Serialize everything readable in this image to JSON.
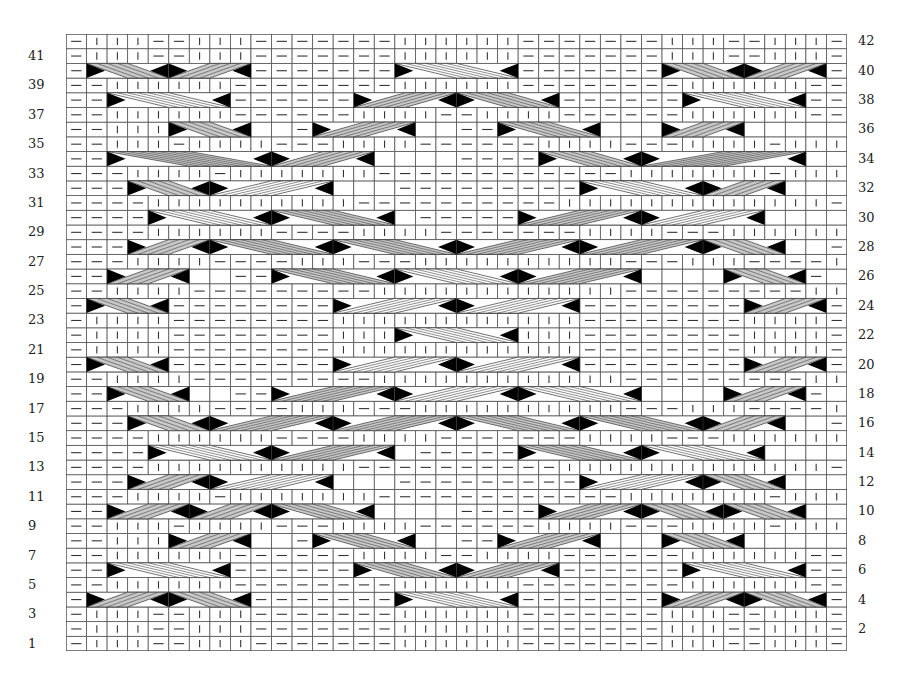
{
  "chart_data": {
    "type": "table",
    "columns": 38,
    "rows": 42,
    "legend": {
      "K": "knit stitch (vertical bar)",
      "P": "purl stitch (horizontal dash)",
      "cable_gray": "gray-filled cable cross",
      "cable_white": "white-filled cable cross",
      "black_triangle": "cable end marker"
    },
    "colors": {
      "grid": "#555555",
      "gray_cable": "#c8c8c8",
      "white_cable": "#ffffff",
      "marker": "#000000",
      "symbol": "#333333"
    },
    "left_labels": [
      "41",
      "39",
      "37",
      "35",
      "33",
      "31",
      "29",
      "27",
      "25",
      "23",
      "21",
      "19",
      "17",
      "15",
      "13",
      "11",
      "9",
      "7",
      "5",
      "3",
      "1"
    ],
    "right_labels": [
      "42",
      "40",
      "38",
      "36",
      "34",
      "32",
      "30",
      "28",
      "26",
      "24",
      "22",
      "20",
      "18",
      "16",
      "14",
      "12",
      "10",
      "8",
      "6",
      "4",
      "2"
    ],
    "row_stitches": {
      "42": "PKKKPPKKKPPPPPPPKKKKKKPPPPPPPKKKPPKKKP",
      "41": "PKKKPPKKKPPPPPPPKKKKKKPPPPPPPKKKPPKKKP",
      "40": "PCCCCCCCCPPPPPPPCCCCCCPPPPPPPCCCCCCCCP",
      "39": "PPKKKKKKPPPPPPPPKKKKKKPPPPPPPPKKKKKKPP",
      "38": "PPCCCCCCPPPPPPCCCCCCCCCCPPPPPPCCCCCCPP",
      "37": "PPKKKKKKPPPPPPKKKKPPKKKKPPPPPPKKKKKKPP",
      "36": "PPKKKCCCCCCPPPCCCCCPPPPPCCCCCPPPCCCCCCKKKPP",
      "35": "PPKKKPKKKKPPPKKKKPPPPPPKKKKPPPKKKKPKKKPP",
      "34": "PPCCCCCCCCCCCCCCCCCPPPPPPPPCCCCCCCCCCCCCCCCCPP",
      "33": "PPPKKKKPKKKKKKKPPPPPPPPPPPPKKKKKKKPKKKKPPP",
      "32": "PPPCCCCCCCCCCCCCPPPPPPPPPPPPCCCCCCCCCCCCCPPP",
      "31": "PPPPKKKKKKKKKKPPPPPPPPPPKKKKKKKKKKKKKPPPP",
      "30": "PPPPCCCCCCCCCCCCCPPPPPPPPCCCCCCCCCCCCCPPPP",
      "29": "PPPPKKKKKKPPPPKKKKPPPPPPPKKKKPPPKKKKKKPPPP",
      "28": "PPPCCCCCCCCCCCCCCCCCCCCCCCCCCCCCCCCCCPPP",
      "27": "PPPKKKKPPPPKKKPPPKKKKKKKKKKPPPKKKPPPPKKKKPPP",
      "26": "PPCCCCCCPPPPPCCCCCCCCCCCCCCCCCCCPPPPPCCCCCCPP",
      "25": "PPKKKKPPPPPPPPPKKKKKKKKKKKKPPPPPPPPPKKKKPP",
      "24": "PCCCCPPPPPPPPCCCCCCCCCCCCPPPPPPPPCCCCP",
      "23": "PKKKKPPPPPPPPKKKKKKKKKKKKPPPPPPPPKKKKP",
      "22": "PKKKKPPPPPPPPKKKCCCCCCKKKPPPPPPPPKKKKP",
      "21": "PKKKKPPPPPPPPKKKKKKKKKKKKPPPPPPPPKKKKP",
      "20": "PCCCCPPPPPPPPCCCCCCCCCCCCPPPPPPPPCCCCP",
      "19": "PPKKKKPPPPPPPPPKKKKKKKKKKKKPPPPPPPPPKKKKPP",
      "18": "PPCCCCCCPPPPPCCCCCCCCCCCCCCCCCCCPPPPPCCCCCCPP",
      "17": "PPPKKKKPPPPKKKPPPKKKKKKKKKKPPPKKKPPPPKKKKPPP",
      "16": "PPPCCCCCCCCCCCCCCCCCCCCCCCCCCCCCCCCCCPPP",
      "15": "PPPPKKKKKKPPPPKKKKPPPPPPPKKKKPPPKKKKKKPPPP",
      "14": "PPPPCCCCCCCCCCCCCPPPPPPPPCCCCCCCCCCCCCPPPP",
      "13": "PPPPKKKKKKKKKKPPPPPPPPPPKKKKKKKKKKKKKPPPP",
      "12": "PPPCCCCCCCCCCCCCPPPPPPPPPPPPCCCCCCCCCCCCCPPP",
      "11": "PPPKKKKPKKKKKKKPPPPPPPPPPPPKKKKKKKPKKKKPPP",
      "10": "PPCCCCCCCCCCCCCCCCCPPPPPPPPCCCCCCCCCCCCCCCCCPP",
      "9": "PPKKKPKKKKPPPKKKKPPPPPPKKKKPPPKKKKPKKKPP",
      "8": "PPKKKCCCCCCPPPCCCCCPPPPPCCCCCPPPCCCCCCKKKPP",
      "7": "PPKKKKKKPPPPPPKKKKPPKKKKPPPPPPKKKKKKPP",
      "6": "PPCCCCCCPPPPPPCCCCCCCCCCPPPPPPCCCCCCPP",
      "5": "PPKKKKKKPPPPPPPPKKKKKKPPPPPPPPKKKKKKPP",
      "4": "PCCCCCCCCPPPPPPPCCCCCCPPPPPPPCCCCCCCCP",
      "3": "PKKKPPKKKPPPPPPPKKKKKKPPPPPPPKKKPPKKKP",
      "2": "PKKKPPKKKPPPPPPPKKKKKKPPPPPPPKKKPPKKKP",
      "1": "PKKKPPKKKPPPPPPPKKKKKKPPPPPPPKKKPPKKKP"
    },
    "cables": {
      "40": [
        [
          1,
          4,
          "g",
          "l"
        ],
        [
          5,
          4,
          "g",
          "r"
        ],
        [
          16,
          6,
          "w",
          "l"
        ],
        [
          29,
          4,
          "g",
          "l"
        ],
        [
          33,
          4,
          "g",
          "r"
        ]
      ],
      "38": [
        [
          2,
          6,
          "w",
          "l"
        ],
        [
          14,
          5,
          "g",
          "r"
        ],
        [
          19,
          5,
          "g",
          "l"
        ],
        [
          30,
          6,
          "w",
          "l"
        ]
      ],
      "36": [
        [
          5,
          4,
          "g",
          "l"
        ],
        [
          12,
          5,
          "g",
          "r"
        ],
        [
          21,
          5,
          "g",
          "l"
        ],
        [
          29,
          4,
          "g",
          "r"
        ]
      ],
      "34": [
        [
          2,
          8,
          "g",
          "l"
        ],
        [
          10,
          5,
          "g",
          "r"
        ],
        [
          23,
          5,
          "g",
          "l"
        ],
        [
          28,
          8,
          "g",
          "r"
        ]
      ],
      "32": [
        [
          3,
          4,
          "g",
          "l"
        ],
        [
          7,
          6,
          "w",
          "r"
        ],
        [
          25,
          6,
          "w",
          "l"
        ],
        [
          31,
          4,
          "g",
          "r"
        ]
      ],
      "30": [
        [
          4,
          6,
          "w",
          "l"
        ],
        [
          10,
          6,
          "g",
          "l"
        ],
        [
          22,
          6,
          "g",
          "r"
        ],
        [
          28,
          6,
          "w",
          "r"
        ]
      ],
      "28": [
        [
          3,
          4,
          "g",
          "r"
        ],
        [
          7,
          6,
          "g",
          "l"
        ],
        [
          13,
          6,
          "g",
          "l"
        ],
        [
          19,
          6,
          "g",
          "r"
        ],
        [
          25,
          6,
          "g",
          "r"
        ],
        [
          31,
          4,
          "g",
          "l"
        ]
      ],
      "26": [
        [
          2,
          4,
          "g",
          "r"
        ],
        [
          10,
          6,
          "g",
          "l"
        ],
        [
          16,
          6,
          "w",
          "l"
        ],
        [
          22,
          6,
          "g",
          "r"
        ],
        [
          32,
          4,
          "g",
          "l"
        ]
      ],
      "24": [
        [
          1,
          4,
          "g",
          "l"
        ],
        [
          13,
          6,
          "w",
          "r"
        ],
        [
          19,
          6,
          "w",
          "r"
        ],
        [
          33,
          4,
          "g",
          "r"
        ]
      ],
      "22": [
        [
          16,
          6,
          "w",
          "l"
        ]
      ],
      "20": [
        [
          1,
          4,
          "g",
          "l"
        ],
        [
          13,
          6,
          "w",
          "r"
        ],
        [
          19,
          6,
          "w",
          "r"
        ],
        [
          33,
          4,
          "g",
          "r"
        ]
      ],
      "18": [
        [
          2,
          4,
          "g",
          "l"
        ],
        [
          10,
          6,
          "g",
          "r"
        ],
        [
          16,
          6,
          "w",
          "r"
        ],
        [
          22,
          6,
          "w",
          "l"
        ],
        [
          32,
          4,
          "g",
          "r"
        ]
      ],
      "16": [
        [
          3,
          4,
          "g",
          "l"
        ],
        [
          7,
          6,
          "g",
          "r"
        ],
        [
          13,
          6,
          "g",
          "r"
        ],
        [
          19,
          6,
          "g",
          "l"
        ],
        [
          25,
          6,
          "g",
          "l"
        ],
        [
          31,
          4,
          "g",
          "r"
        ]
      ],
      "14": [
        [
          4,
          6,
          "w",
          "l"
        ],
        [
          10,
          6,
          "g",
          "r"
        ],
        [
          22,
          6,
          "g",
          "l"
        ],
        [
          28,
          6,
          "w",
          "l"
        ]
      ],
      "12": [
        [
          3,
          4,
          "g",
          "r"
        ],
        [
          7,
          6,
          "w",
          "r"
        ],
        [
          25,
          6,
          "w",
          "r"
        ],
        [
          31,
          4,
          "g",
          "l"
        ]
      ],
      "10": [
        [
          2,
          4,
          "g",
          "r"
        ],
        [
          6,
          4,
          "g",
          "r"
        ],
        [
          10,
          5,
          "g",
          "l"
        ],
        [
          23,
          5,
          "g",
          "r"
        ],
        [
          28,
          4,
          "g",
          "l"
        ],
        [
          32,
          4,
          "g",
          "l"
        ]
      ],
      "8": [
        [
          5,
          4,
          "g",
          "r"
        ],
        [
          12,
          5,
          "g",
          "l"
        ],
        [
          21,
          5,
          "g",
          "r"
        ],
        [
          29,
          4,
          "g",
          "l"
        ]
      ],
      "6": [
        [
          2,
          6,
          "w",
          "l"
        ],
        [
          14,
          5,
          "g",
          "l"
        ],
        [
          19,
          5,
          "g",
          "r"
        ],
        [
          30,
          6,
          "w",
          "l"
        ]
      ],
      "4": [
        [
          1,
          4,
          "g",
          "r"
        ],
        [
          5,
          4,
          "g",
          "l"
        ],
        [
          16,
          6,
          "w",
          "l"
        ],
        [
          29,
          4,
          "g",
          "r"
        ],
        [
          33,
          4,
          "g",
          "l"
        ]
      ]
    }
  }
}
